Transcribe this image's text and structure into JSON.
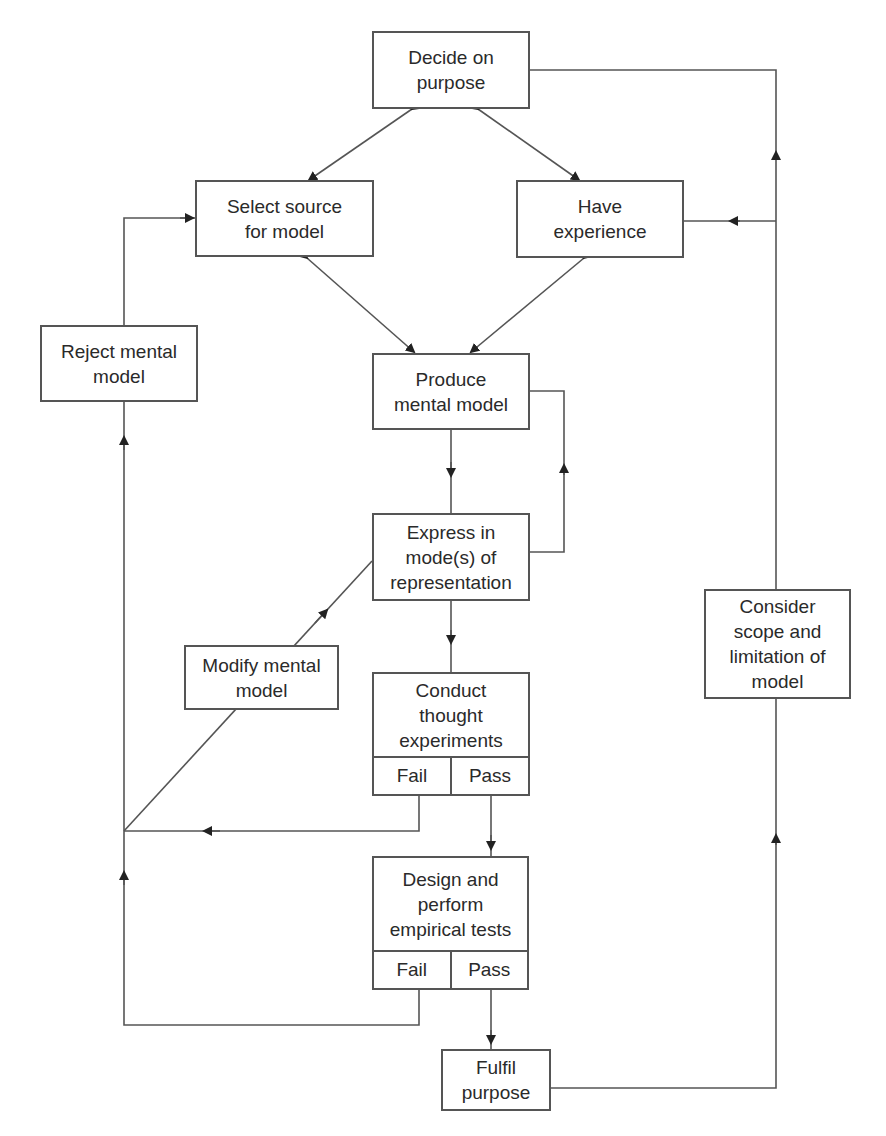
{
  "diagram": {
    "nodes": {
      "decide": {
        "label": "Decide on\npurpose"
      },
      "select": {
        "label": "Select source\nfor model"
      },
      "have": {
        "label": "Have\nexperience"
      },
      "reject": {
        "label": "Reject mental\nmodel"
      },
      "produce": {
        "label": "Produce\nmental model"
      },
      "express": {
        "label": "Express in\nmode(s) of\nrepresentation"
      },
      "modify": {
        "label": "Modify mental\nmodel"
      },
      "conduct": {
        "label": "Conduct\nthought\nexperiments",
        "fail": "Fail",
        "pass": "Pass"
      },
      "design": {
        "label": "Design and\nperform\nempirical tests",
        "fail": "Fail",
        "pass": "Pass"
      },
      "fulfil": {
        "label": "Fulfil\npurpose"
      },
      "consider": {
        "label": "Consider\nscope and\nlimitation of\nmodel"
      }
    },
    "colors": {
      "line": "#555555",
      "text": "#2a2a2a",
      "background": "#ffffff"
    }
  }
}
